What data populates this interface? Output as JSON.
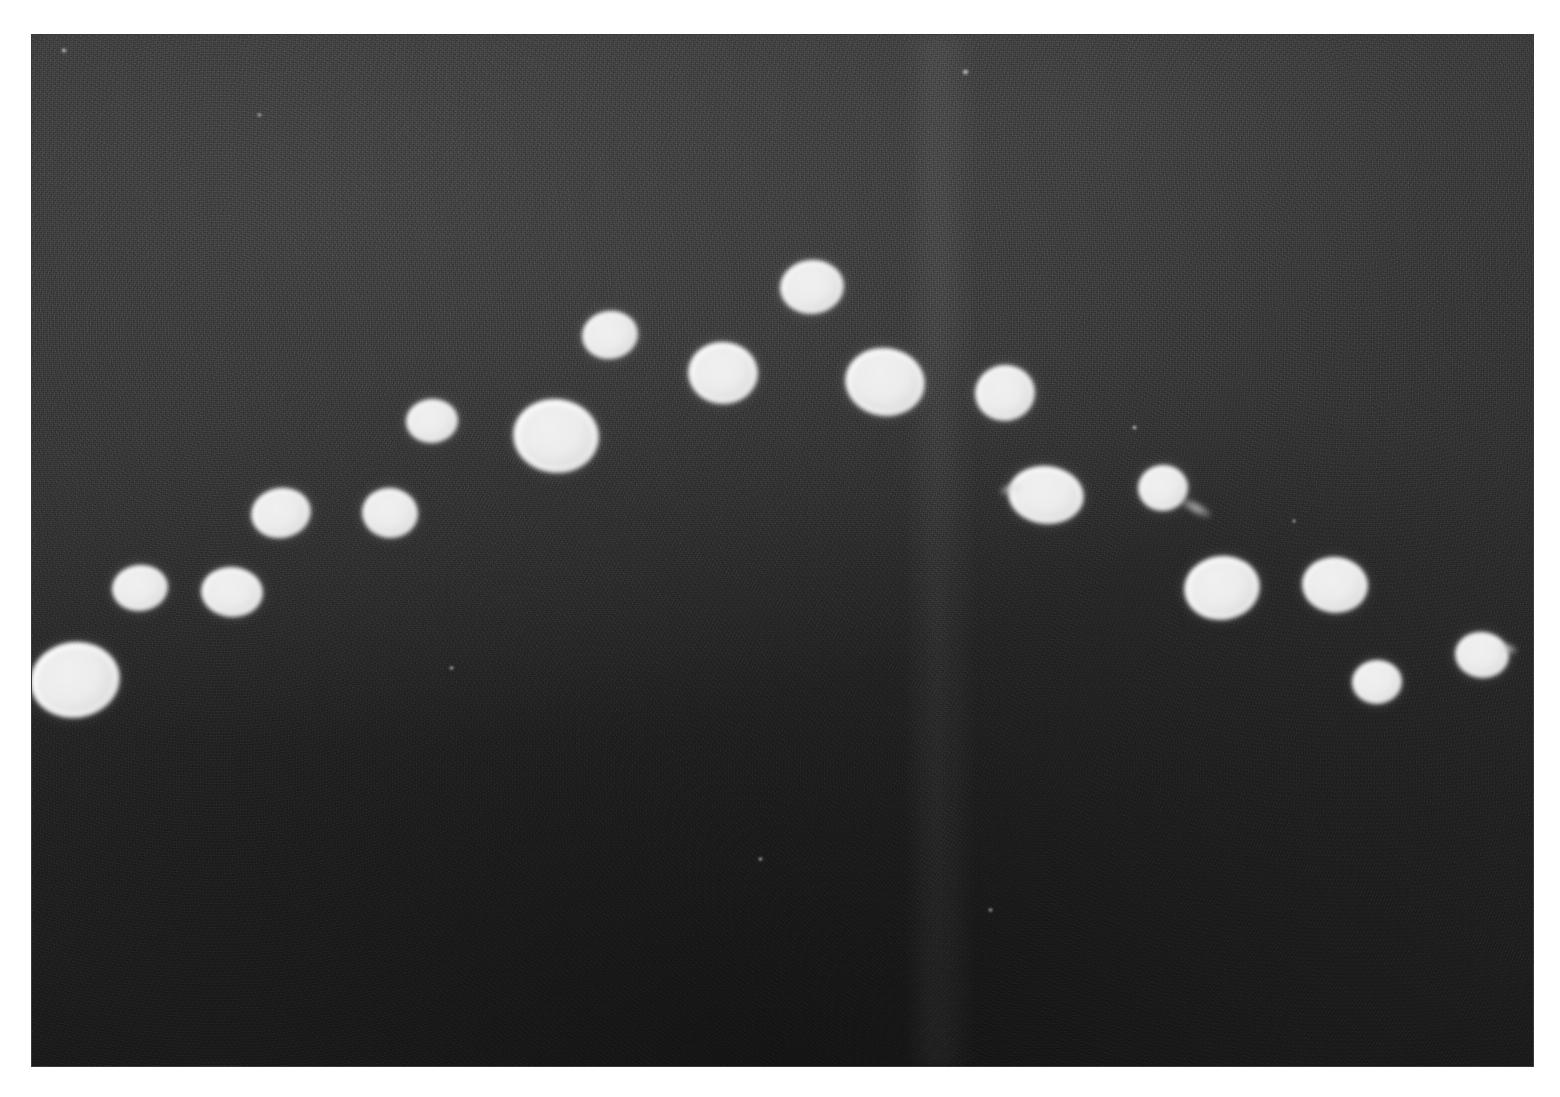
{
  "image": {
    "kind": "photographic-plate",
    "description": "Dark grainy photographic micrograph with bright white circular colonies arranged in an arc",
    "canvas": {
      "width": 1560,
      "height": 1097
    },
    "plate": {
      "left": 32,
      "top": 35,
      "width": 1501,
      "height": 1031
    },
    "colors": {
      "page_background": "#ffffff",
      "plate_background": "#2c2c2c",
      "plate_background_light": "#3a3a3a",
      "plate_background_dark": "#222222",
      "spot_core": "#ffffff",
      "spot_edge": "#d2d2d2"
    }
  },
  "chart_data": {
    "type": "scatter",
    "title": "",
    "subtitle": "",
    "xlabel": "",
    "ylabel": "",
    "grid": false,
    "legend": "none",
    "xlim": [
      32,
      1533
    ],
    "ylim": [
      35,
      1066
    ],
    "note": "Bright circular colonies/spots on dark plate; x,y are pixel centers, w,h are spot diameters in pixels",
    "series": [
      {
        "name": "colonies",
        "points": [
          {
            "id": 1,
            "x": 75,
            "y": 680,
            "w": 90,
            "h": 76,
            "tilt": -8
          },
          {
            "id": 2,
            "x": 140,
            "y": 588,
            "w": 56,
            "h": 46,
            "tilt": -6
          },
          {
            "id": 3,
            "x": 232,
            "y": 592,
            "w": 62,
            "h": 50,
            "tilt": 4
          },
          {
            "id": 4,
            "x": 281,
            "y": 513,
            "w": 60,
            "h": 50,
            "tilt": -10
          },
          {
            "id": 5,
            "x": 390,
            "y": 513,
            "w": 56,
            "h": 50,
            "tilt": 6
          },
          {
            "id": 6,
            "x": 432,
            "y": 421,
            "w": 52,
            "h": 44,
            "tilt": -4
          },
          {
            "id": 7,
            "x": 556,
            "y": 436,
            "w": 86,
            "h": 74,
            "tilt": 6
          },
          {
            "id": 8,
            "x": 610,
            "y": 335,
            "w": 56,
            "h": 48,
            "tilt": -8
          },
          {
            "id": 9,
            "x": 723,
            "y": 373,
            "w": 70,
            "h": 62,
            "tilt": 3
          },
          {
            "id": 10,
            "x": 812,
            "y": 287,
            "w": 64,
            "h": 54,
            "tilt": -5
          },
          {
            "id": 11,
            "x": 885,
            "y": 382,
            "w": 80,
            "h": 68,
            "tilt": 8
          },
          {
            "id": 12,
            "x": 1005,
            "y": 393,
            "w": 60,
            "h": 56,
            "tilt": -6
          },
          {
            "id": 13,
            "x": 1046,
            "y": 495,
            "w": 76,
            "h": 58,
            "tilt": 6
          },
          {
            "id": 14,
            "x": 1163,
            "y": 488,
            "w": 50,
            "h": 46,
            "tilt": -4
          },
          {
            "id": 15,
            "x": 1222,
            "y": 588,
            "w": 76,
            "h": 64,
            "tilt": -7
          },
          {
            "id": 16,
            "x": 1335,
            "y": 585,
            "w": 66,
            "h": 56,
            "tilt": 5
          },
          {
            "id": 17,
            "x": 1377,
            "y": 682,
            "w": 50,
            "h": 44,
            "tilt": -3
          },
          {
            "id": 18,
            "x": 1482,
            "y": 655,
            "w": 54,
            "h": 46,
            "tilt": 7
          }
        ]
      }
    ],
    "artifacts": {
      "tails": [
        {
          "x": 1196,
          "y": 508,
          "w": 34,
          "h": 12,
          "tilt": 28
        },
        {
          "x": 1010,
          "y": 489,
          "w": 22,
          "h": 10,
          "tilt": -18
        },
        {
          "x": 1509,
          "y": 648,
          "w": 18,
          "h": 9,
          "tilt": 24
        }
      ],
      "flecks": [
        {
          "x": 259,
          "y": 115,
          "w": 5,
          "h": 4
        },
        {
          "x": 965,
          "y": 72,
          "w": 7,
          "h": 6
        },
        {
          "x": 1134,
          "y": 427,
          "w": 5,
          "h": 5
        },
        {
          "x": 451,
          "y": 668,
          "w": 5,
          "h": 4
        },
        {
          "x": 760,
          "y": 859,
          "w": 5,
          "h": 4
        },
        {
          "x": 990,
          "y": 910,
          "w": 5,
          "h": 4
        },
        {
          "x": 1294,
          "y": 521,
          "w": 4,
          "h": 4
        },
        {
          "x": 64,
          "y": 50,
          "w": 6,
          "h": 5
        }
      ],
      "light_streak": {
        "left_pct": 58,
        "width_pct": 5
      }
    }
  }
}
